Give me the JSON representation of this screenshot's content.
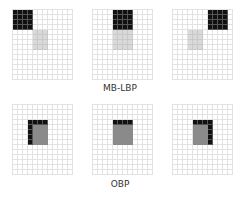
{
  "figure": {
    "grid": {
      "cols": 12,
      "rows": 14,
      "cell_px": 5,
      "line_color": "#e2e2e2"
    },
    "colors": {
      "black": "#111111",
      "light_gray": "#d9d9d9",
      "dark_gray": "#8a8a8a"
    },
    "rows": [
      {
        "label": "MB-LBP",
        "label_y": 83,
        "panels": [
          {
            "x": 12,
            "y": 9,
            "black": {
              "col": 0,
              "row": 0,
              "w": 4,
              "h": 4
            },
            "center": {
              "col": 4,
              "row": 4,
              "w": 3,
              "h": 4,
              "tone": "gray"
            }
          },
          {
            "x": 92,
            "y": 9,
            "black": {
              "col": 4,
              "row": 0,
              "w": 4,
              "h": 4
            },
            "center": {
              "col": 4,
              "row": 4,
              "w": 4,
              "h": 4,
              "tone": "gray"
            }
          },
          {
            "x": 172,
            "y": 9,
            "black": {
              "col": 7,
              "row": 0,
              "w": 4,
              "h": 4
            },
            "center": {
              "col": 3,
              "row": 4,
              "w": 3,
              "h": 4,
              "tone": "gray"
            }
          }
        ]
      },
      {
        "label": "OBP",
        "label_y": 179,
        "panels": [
          {
            "x": 12,
            "y": 104,
            "obp": {
              "col": 3,
              "row": 3,
              "w": 4,
              "h": 5,
              "edge": [
                "top",
                "left"
              ]
            }
          },
          {
            "x": 92,
            "y": 104,
            "obp": {
              "col": 4,
              "row": 3,
              "w": 4,
              "h": 5,
              "edge": [
                "top"
              ]
            }
          },
          {
            "x": 172,
            "y": 104,
            "obp": {
              "col": 4,
              "row": 3,
              "w": 4,
              "h": 5,
              "edge": [
                "top",
                "right"
              ]
            }
          }
        ]
      }
    ]
  }
}
